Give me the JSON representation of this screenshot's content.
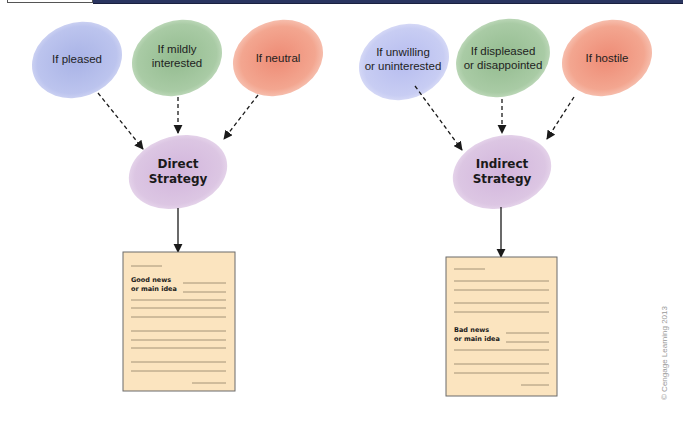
{
  "header_bar": {
    "color": "#2a3560"
  },
  "left_diagram": {
    "inputs": [
      {
        "line1": "If pleased",
        "line2": "",
        "color": "#b7c0ea"
      },
      {
        "line1": "If mildly",
        "line2": "interested",
        "color": "#a9cba5"
      },
      {
        "line1": "If neutral",
        "line2": "",
        "color": "#f2a48e"
      }
    ],
    "strategy": {
      "line1": "Direct",
      "line2": "Strategy",
      "color": "#d9c3e0"
    },
    "document": {
      "line1": "Good news",
      "line2": "or main idea",
      "color": "#fbe5c0"
    }
  },
  "right_diagram": {
    "inputs": [
      {
        "line1": "If unwilling",
        "line2": "or uninterested",
        "color": "#c3c8ef"
      },
      {
        "line1": "If displeased",
        "line2": "or disappointed",
        "color": "#a9cba5"
      },
      {
        "line1": "If hostile",
        "line2": "",
        "color": "#f2a48e"
      }
    ],
    "strategy": {
      "line1": "Indirect",
      "line2": "Strategy",
      "color": "#d9c3e0"
    },
    "document": {
      "line1": "Bad news",
      "line2": "or main idea",
      "color": "#fbe5c0"
    }
  },
  "credit": "© Cengage Learning 2013"
}
